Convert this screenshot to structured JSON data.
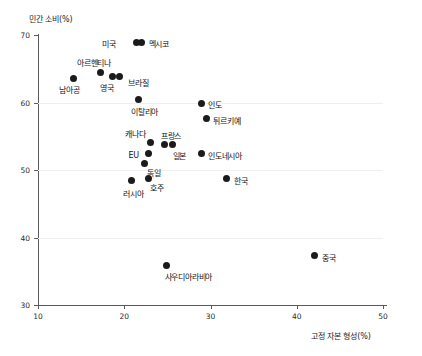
{
  "chart_data": {
    "type": "scatter",
    "title": "",
    "xlabel": "고정 자본 형성(%)",
    "ylabel": "민간 소비(%)",
    "xlim": [
      10,
      50
    ],
    "ylim": [
      30,
      70
    ],
    "xticks": [
      "10",
      "20",
      "30",
      "40",
      "50"
    ],
    "yticks": [
      "70",
      "60",
      "50",
      "40",
      "30"
    ],
    "grid": "horizontal",
    "legend": "none",
    "points": [
      {
        "label": "미국",
        "x": 21.4,
        "y": 68.9,
        "label_dx": -34,
        "label_dy": -4
      },
      {
        "label": "멕시코",
        "x": 22.0,
        "y": 68.9,
        "label_dx": 7,
        "label_dy": -4
      },
      {
        "label": "아르헨티나",
        "x": 17.3,
        "y": 64.4,
        "label_dx": -24,
        "label_dy": -16
      },
      {
        "label": "영국",
        "x": 18.6,
        "y": 63.9,
        "label_dx": -12,
        "label_dy": 6
      },
      {
        "label": "브라질",
        "x": 19.5,
        "y": 63.9,
        "label_dx": 8,
        "label_dy": 1
      },
      {
        "label": "남아공",
        "x": 14.1,
        "y": 63.6,
        "label_dx": -14,
        "label_dy": 6
      },
      {
        "label": "이탈리아",
        "x": 21.7,
        "y": 60.4,
        "label_dx": -8,
        "label_dy": 6
      },
      {
        "label": "인도",
        "x": 28.9,
        "y": 59.9,
        "label_dx": 7,
        "label_dy": -4
      },
      {
        "label": "튀르키예",
        "x": 29.5,
        "y": 57.6,
        "label_dx": 7,
        "label_dy": -4
      },
      {
        "label": "캐나다",
        "x": 23.1,
        "y": 54.1,
        "label_dx": -26,
        "label_dy": -14
      },
      {
        "label": "프랑스",
        "x": 24.7,
        "y": 53.8,
        "label_dx": -4,
        "label_dy": -14
      },
      {
        "label": "일본",
        "x": 25.6,
        "y": 53.8,
        "label_dx": 0,
        "label_dy": 6
      },
      {
        "label": "EU",
        "x": 22.8,
        "y": 52.4,
        "label_dx": -20,
        "label_dy": -3
      },
      {
        "label": "인도네시아",
        "x": 28.9,
        "y": 52.4,
        "label_dx": 7,
        "label_dy": -4
      },
      {
        "label": "독일",
        "x": 22.4,
        "y": 51.0,
        "label_dx": 2,
        "label_dy": 4
      },
      {
        "label": "호주",
        "x": 22.8,
        "y": 48.8,
        "label_dx": 2,
        "label_dy": 4
      },
      {
        "label": "러시아",
        "x": 20.8,
        "y": 48.5,
        "label_dx": -8,
        "label_dy": 8
      },
      {
        "label": "한국",
        "x": 31.9,
        "y": 48.7,
        "label_dx": 7,
        "label_dy": -4
      },
      {
        "label": "중국",
        "x": 42.1,
        "y": 37.3,
        "label_dx": 7,
        "label_dy": -4
      },
      {
        "label": "사우디아라비아",
        "x": 24.9,
        "y": 35.9,
        "label_dx": -2,
        "label_dy": 6
      }
    ]
  },
  "axis": {
    "y_title": "민간 소비(%)",
    "x_title": "고정 자본 형성(%)"
  }
}
